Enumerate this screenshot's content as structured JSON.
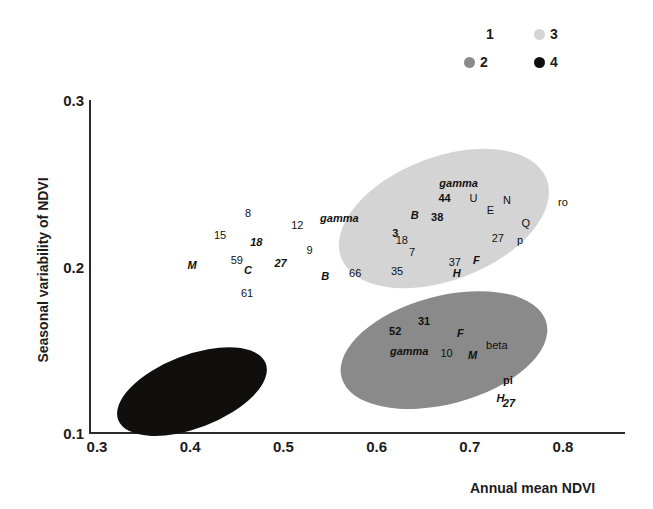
{
  "chart_data": {
    "type": "scatter",
    "title": "",
    "xlabel": "Annual mean NDVI",
    "ylabel": "Seasonal variability of NDVI",
    "xlim": [
      0.3,
      0.85
    ],
    "ylim": [
      0.1,
      0.3
    ],
    "xticks": [
      "0.3",
      "0.4",
      "0.5",
      "0.6",
      "0.7",
      "0.8"
    ],
    "yticks": [
      "0.3",
      "0.2",
      "0.1"
    ],
    "grid": false,
    "legend_position": "top-right",
    "legend": [
      {
        "label": "1",
        "color": "#ffffff"
      },
      {
        "label": "3",
        "color": "#d4d4d4"
      },
      {
        "label": "2",
        "color": "#8a8a8a"
      },
      {
        "label": "4",
        "color": "#100f0d"
      }
    ],
    "clusters": [
      {
        "name": "1",
        "fill": "#ffffff",
        "hull": null,
        "points": [
          {
            "label": "8",
            "x": 0.462,
            "y": 0.232,
            "style": "plain"
          },
          {
            "label": "12",
            "x": 0.515,
            "y": 0.225,
            "style": "plain"
          },
          {
            "label": "gamma",
            "x": 0.56,
            "y": 0.229,
            "style": "bi"
          },
          {
            "label": "15",
            "x": 0.432,
            "y": 0.219,
            "style": "plain"
          },
          {
            "label": "18",
            "x": 0.471,
            "y": 0.215,
            "style": "bi"
          },
          {
            "label": "9",
            "x": 0.528,
            "y": 0.21,
            "style": "plain"
          },
          {
            "label": "59",
            "x": 0.45,
            "y": 0.204,
            "style": "plain"
          },
          {
            "label": "27",
            "x": 0.497,
            "y": 0.202,
            "style": "bi"
          },
          {
            "label": "M",
            "x": 0.402,
            "y": 0.201,
            "style": "bi"
          },
          {
            "label": "C",
            "x": 0.462,
            "y": 0.198,
            "style": "bi"
          },
          {
            "label": "B",
            "x": 0.545,
            "y": 0.194,
            "style": "bi"
          },
          {
            "label": "66",
            "x": 0.577,
            "y": 0.196,
            "style": "plain"
          },
          {
            "label": "61",
            "x": 0.461,
            "y": 0.184,
            "style": "plain"
          }
        ]
      },
      {
        "name": "3",
        "fill": "#d4d4d4",
        "hull": {
          "cx": 0.672,
          "cy": 0.229,
          "w": 0.236,
          "h": 0.074,
          "angle": -21
        },
        "points": [
          {
            "label": "gamma",
            "x": 0.688,
            "y": 0.25,
            "style": "bi"
          },
          {
            "label": "44",
            "x": 0.673,
            "y": 0.241,
            "style": "bold"
          },
          {
            "label": "U",
            "x": 0.704,
            "y": 0.241,
            "style": "plain"
          },
          {
            "label": "N",
            "x": 0.74,
            "y": 0.24,
            "style": "plain"
          },
          {
            "label": "ro",
            "x": 0.8,
            "y": 0.239,
            "style": "plain"
          },
          {
            "label": "E",
            "x": 0.722,
            "y": 0.234,
            "style": "plain"
          },
          {
            "label": "B",
            "x": 0.641,
            "y": 0.231,
            "style": "bi"
          },
          {
            "label": "38",
            "x": 0.665,
            "y": 0.23,
            "style": "bold"
          },
          {
            "label": "Q",
            "x": 0.76,
            "y": 0.226,
            "style": "plain"
          },
          {
            "label": "3",
            "x": 0.62,
            "y": 0.22,
            "style": "bold"
          },
          {
            "label": "18",
            "x": 0.627,
            "y": 0.216,
            "style": "plain"
          },
          {
            "label": "27",
            "x": 0.73,
            "y": 0.217,
            "style": "plain"
          },
          {
            "label": "p",
            "x": 0.754,
            "y": 0.216,
            "style": "plain"
          },
          {
            "label": "7",
            "x": 0.638,
            "y": 0.209,
            "style": "plain"
          },
          {
            "label": "37",
            "x": 0.684,
            "y": 0.203,
            "style": "plain"
          },
          {
            "label": "F",
            "x": 0.707,
            "y": 0.204,
            "style": "bi"
          },
          {
            "label": "35",
            "x": 0.622,
            "y": 0.197,
            "style": "plain"
          },
          {
            "label": "H",
            "x": 0.686,
            "y": 0.196,
            "style": "bi"
          }
        ]
      },
      {
        "name": "2",
        "fill": "#8a8a8a",
        "hull": {
          "cx": 0.673,
          "cy": 0.15,
          "w": 0.228,
          "h": 0.065,
          "angle": -15
        },
        "points": [
          {
            "label": "31",
            "x": 0.651,
            "y": 0.167,
            "style": "bold"
          },
          {
            "label": "52",
            "x": 0.62,
            "y": 0.161,
            "style": "bold"
          },
          {
            "label": "F",
            "x": 0.69,
            "y": 0.16,
            "style": "bi"
          },
          {
            "label": "beta",
            "x": 0.729,
            "y": 0.153,
            "style": "plain"
          },
          {
            "label": "gamma",
            "x": 0.635,
            "y": 0.149,
            "style": "bi"
          },
          {
            "label": "10",
            "x": 0.675,
            "y": 0.148,
            "style": "plain"
          },
          {
            "label": "M",
            "x": 0.703,
            "y": 0.147,
            "style": "bi"
          },
          {
            "label": "pi",
            "x": 0.741,
            "y": 0.132,
            "style": "bold"
          },
          {
            "label": "H",
            "x": 0.733,
            "y": 0.121,
            "style": "bi"
          },
          {
            "label": "27",
            "x": 0.742,
            "y": 0.118,
            "style": "bi"
          }
        ]
      },
      {
        "name": "4",
        "fill": "#100f0d",
        "hull": {
          "cx": 0.402,
          "cy": 0.125,
          "w": 0.17,
          "h": 0.044,
          "angle": -21
        },
        "points": []
      }
    ]
  }
}
